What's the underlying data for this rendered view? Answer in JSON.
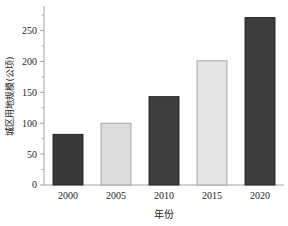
{
  "chart_data": {
    "type": "bar",
    "title": "",
    "subtitle": "",
    "xlabel": "年份",
    "ylabel": "城区用地规模(公顷)",
    "categories": [
      "2000",
      "2005",
      "2010",
      "2015",
      "2020"
    ],
    "values": [
      82,
      100,
      143,
      201,
      271
    ],
    "series": [
      {
        "name": "城区用地规模",
        "values": [
          82,
          100,
          143,
          201,
          271
        ]
      }
    ],
    "bar_colors": [
      "#383838",
      "#dcdcdc",
      "#3d3d3d",
      "#e4e4e4",
      "#3c3c3c"
    ],
    "bar_border_colors": [
      "#1f1f1f",
      "#9d9d9d",
      "#1f1f1f",
      "#9d9d9d",
      "#1f1f1f"
    ],
    "ylim": [
      0,
      280
    ],
    "xlim_note": "categorical",
    "y_ticks": [
      0,
      50,
      100,
      150,
      200,
      250
    ],
    "y_tick_labels": [
      "0",
      "50",
      "100",
      "150",
      "200",
      "250"
    ],
    "y_minor_ticks": [
      25,
      75,
      125,
      175,
      225,
      275
    ],
    "x_tick_labels": [
      "2000",
      "2005",
      "2010",
      "2015",
      "2020"
    ],
    "grid": false,
    "legend": false,
    "legend_position": "none",
    "annotations": []
  },
  "figure": {
    "background_color": "#ffffff",
    "axis_color": "#9a9a9a",
    "text_color": "#262626"
  }
}
